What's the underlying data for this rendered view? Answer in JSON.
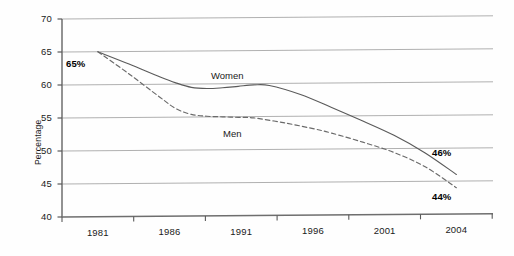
{
  "chart_data": {
    "type": "line",
    "title": "",
    "subtitle": "",
    "xlabel": "",
    "ylabel": "Percentage",
    "xlim": [
      1980,
      2004
    ],
    "ylim": [
      40,
      70
    ],
    "grid": true,
    "grid_axis": "y",
    "legend": "inline-labels",
    "y_ticks": [
      "70",
      "65",
      "60",
      "55",
      "50",
      "45",
      "40"
    ],
    "y_tick_values": [
      70,
      65,
      60,
      55,
      50,
      45,
      40
    ],
    "x_ticks": [
      "1981",
      "1986",
      "1991",
      "1996",
      "2001",
      "2004"
    ],
    "x_tick_values": [
      1981,
      1986,
      1991,
      1996,
      2001,
      2004
    ],
    "annotations": [
      {
        "name": "start-value",
        "text": "65%",
        "x": 1981,
        "y": 65
      },
      {
        "name": "women-end-value",
        "text": "46%",
        "x": 2004,
        "y": 46
      },
      {
        "name": "men-end-value",
        "text": "44%",
        "x": 2004,
        "y": 44
      }
    ],
    "series": [
      {
        "name": "Women",
        "label": "Women",
        "style": "solid",
        "color": "#5a5a5a",
        "x": [
          1981,
          1983,
          1985,
          1986,
          1987,
          1988,
          1989,
          1990,
          1991,
          1992,
          1994,
          1996,
          1998,
          2000,
          2002,
          2004
        ],
        "values": [
          65,
          63.1,
          61.1,
          60.2,
          59.5,
          59.3,
          59.4,
          59.6,
          59.8,
          59.7,
          58.3,
          56.3,
          54.2,
          52.0,
          49.3,
          46
        ]
      },
      {
        "name": "Men",
        "label": "Men",
        "style": "dashed",
        "color": "#6a6a6a",
        "x": [
          1981,
          1983,
          1985,
          1986,
          1987,
          1988,
          1989,
          1990,
          1991,
          1993,
          1995,
          1996,
          1998,
          2000,
          2002,
          2004
        ],
        "values": [
          65,
          61.6,
          58.0,
          56.3,
          55.4,
          55.1,
          55.0,
          54.9,
          54.8,
          54.0,
          53.0,
          52.4,
          51.0,
          49.4,
          47.2,
          44
        ]
      }
    ]
  },
  "axes": {
    "y_title": "Percentage"
  }
}
